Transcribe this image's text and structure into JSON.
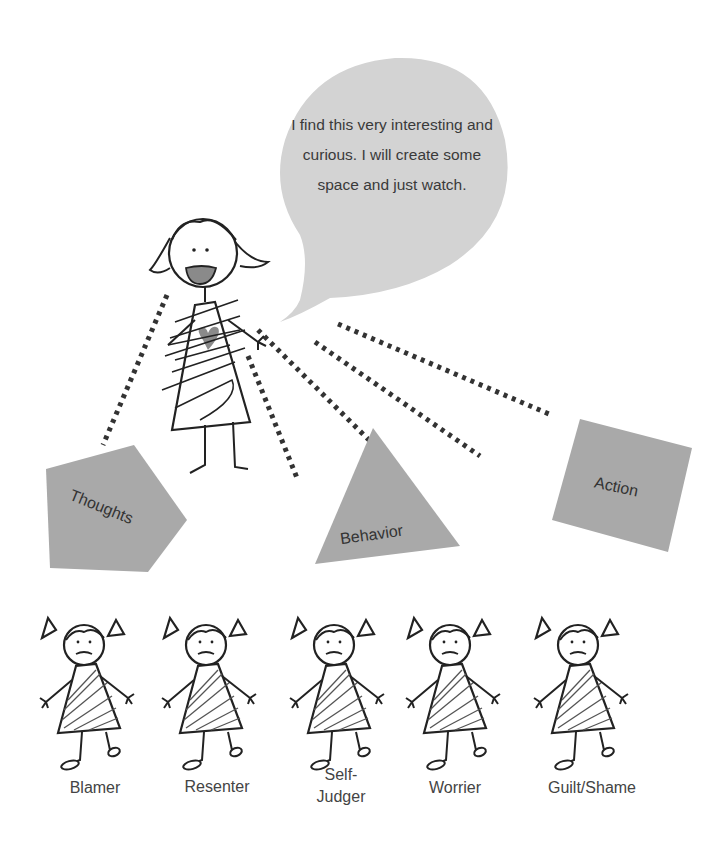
{
  "speech_bubble": {
    "text": "I find this very interesting and curious. I will create some space and just watch.",
    "fill": "#d3d3d3"
  },
  "main_figure": {
    "expression": "smiling",
    "heart_fill": "#8a8a8a"
  },
  "shapes": [
    {
      "id": "thoughts",
      "label": "Thoughts",
      "shape": "pentagon",
      "fill": "#a9a9a9"
    },
    {
      "id": "behavior",
      "label": "Behavior",
      "shape": "triangle",
      "fill": "#a9a9a9"
    },
    {
      "id": "action",
      "label": "Action",
      "shape": "square",
      "fill": "#a9a9a9"
    }
  ],
  "roles": [
    {
      "label": "Blamer"
    },
    {
      "label": "Resenter"
    },
    {
      "label": "Self-Judger",
      "line1": "Self-",
      "line2": "Judger"
    },
    {
      "label": "Worrier"
    },
    {
      "label": "Guilt/Shame"
    }
  ]
}
